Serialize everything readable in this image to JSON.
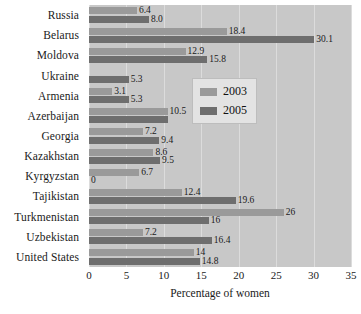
{
  "chart_data": {
    "type": "bar",
    "orientation": "horizontal",
    "title": "",
    "xlabel": "Percentage of women",
    "ylabel": "",
    "xlim": [
      0,
      35
    ],
    "xticks": [
      0,
      5,
      10,
      15,
      20,
      25,
      30,
      35
    ],
    "grid": true,
    "legend_position": "right",
    "categories": [
      "Russia",
      "Belarus",
      "Moldova",
      "Ukraine",
      "Armenia",
      "Azerbaijan",
      "Georgia",
      "Kazakhstan",
      "Kyrgyzstan",
      "Tajikistan",
      "Turkmenistan",
      "Uzbekistan",
      "United States"
    ],
    "series": [
      {
        "name": "2003",
        "color": "#9a9a9a",
        "values": [
          6.4,
          18.4,
          12.9,
          null,
          3.1,
          10.5,
          7.2,
          8.6,
          6.7,
          12.4,
          26,
          7.2,
          14
        ],
        "labels": [
          "6.4",
          "18.4",
          "12.9",
          "",
          "3.1",
          "10.5",
          "7.2",
          "8.6",
          "6.7",
          "12.4",
          "26",
          "7.2",
          "14"
        ]
      },
      {
        "name": "2005",
        "color": "#6e6e6e",
        "values": [
          8.0,
          30.1,
          15.8,
          5.3,
          5.3,
          10.5,
          9.4,
          9.5,
          0,
          19.6,
          16,
          16.4,
          14.8
        ],
        "labels": [
          "8.0",
          "30.1",
          "15.8",
          "5.3",
          "5.3",
          "",
          "9.4",
          "9.5",
          "0",
          "19.6",
          "16",
          "16.4",
          "14.8"
        ]
      }
    ]
  },
  "legend": {
    "items": [
      {
        "label": "2003"
      },
      {
        "label": "2005"
      }
    ]
  },
  "axis": {
    "x_title": "Percentage of women"
  },
  "colors": {
    "series_2003": "#9a9a9a",
    "series_2005": "#6e6e6e",
    "plot_background": "#c8c8c8",
    "gridline": "#dcdcdc",
    "legend_background": "#e3e3e3"
  }
}
